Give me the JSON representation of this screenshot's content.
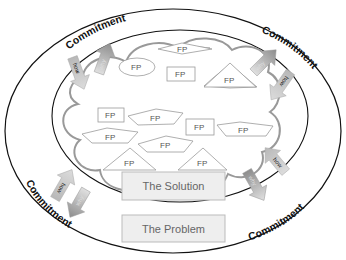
{
  "diagram": {
    "outer_ring_label": "Commitment",
    "commitment_labels": [
      {
        "text": "Commitment",
        "position": "top-left"
      },
      {
        "text": "Commitment",
        "position": "top-right"
      },
      {
        "text": "Commitment",
        "position": "bottom-left"
      },
      {
        "text": "Commitment",
        "position": "bottom-right"
      }
    ],
    "arrows": [
      {
        "label": "how",
        "direction": "in",
        "position": "top-left"
      },
      {
        "label": "why",
        "direction": "out",
        "position": "top-left"
      },
      {
        "label": "how",
        "direction": "in",
        "position": "top-right"
      },
      {
        "label": "why",
        "direction": "out",
        "position": "top-right"
      },
      {
        "label": "how",
        "direction": "in",
        "position": "bottom-left"
      },
      {
        "label": "why",
        "direction": "out",
        "position": "bottom-left"
      },
      {
        "label": "how",
        "direction": "in",
        "position": "bottom-right"
      },
      {
        "label": "why",
        "direction": "out",
        "position": "bottom-right"
      }
    ],
    "fp_shapes": [
      {
        "label": "FP",
        "shape": "diamond"
      },
      {
        "label": "FP",
        "shape": "ellipse"
      },
      {
        "label": "FP",
        "shape": "rectangle"
      },
      {
        "label": "FP",
        "shape": "triangle"
      },
      {
        "label": "FP",
        "shape": "rectangle"
      },
      {
        "label": "FP",
        "shape": "pentagon"
      },
      {
        "label": "FP",
        "shape": "rectangle"
      },
      {
        "label": "FP",
        "shape": "pentagon"
      },
      {
        "label": "FP",
        "shape": "pentagon"
      },
      {
        "label": "FP",
        "shape": "pentagon"
      },
      {
        "label": "FP",
        "shape": "triangle"
      },
      {
        "label": "FP",
        "shape": "triangle"
      }
    ],
    "solution_box": "The Solution",
    "problem_box": "The Problem",
    "colors": {
      "outline": "#111111",
      "cloud": "#999999",
      "shape_stroke": "#9a9a9a",
      "box_fill": "#eeeeee",
      "box_stroke": "#bbbbbb",
      "arrow_in": "#c8c8c8",
      "arrow_out": "#a0a0a0"
    }
  }
}
